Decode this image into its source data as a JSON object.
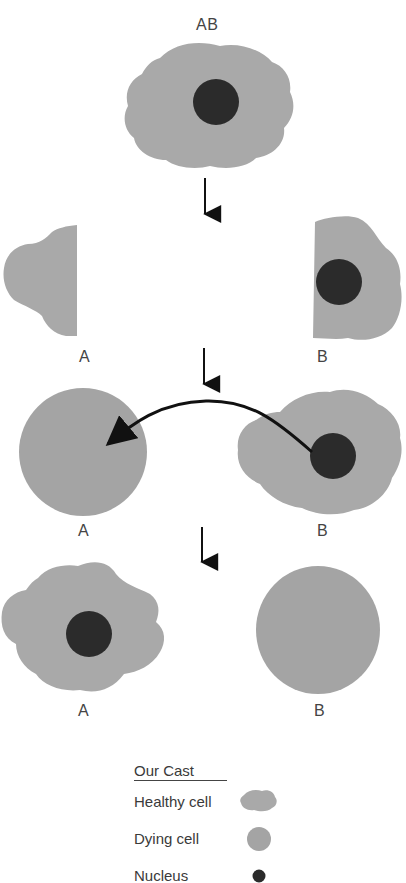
{
  "colors": {
    "healthy_cell": "#a9a9a9",
    "dying_cell": "#a4a4a4",
    "nucleus": "#2b2b2b",
    "arrow": "#111111",
    "text": "#444444"
  },
  "diagram": {
    "stage1": {
      "label": "AB",
      "description": "Healthy cell with nucleus"
    },
    "stage2": {
      "left": {
        "label": "A",
        "description": "Left half of cell, no nucleus"
      },
      "right": {
        "label": "B",
        "description": "Right half of cell with nucleus"
      }
    },
    "stage3": {
      "left": {
        "label": "A",
        "description": "Dying cell (round)"
      },
      "right": {
        "label": "B",
        "description": "Healthy cell with nucleus"
      },
      "transfer_arrow": "Nucleus moved from B to A"
    },
    "stage4": {
      "left": {
        "label": "A",
        "description": "Healthy cell with nucleus"
      },
      "right": {
        "label": "B",
        "description": "Dying cell (round)"
      }
    },
    "flow_arrows": 3
  },
  "legend": {
    "title": "Our Cast",
    "items": [
      {
        "label": "Healthy cell",
        "icon": "healthy-cell-icon"
      },
      {
        "label": "Dying cell",
        "icon": "dying-cell-icon"
      },
      {
        "label": "Nucleus",
        "icon": "nucleus-icon"
      }
    ]
  }
}
